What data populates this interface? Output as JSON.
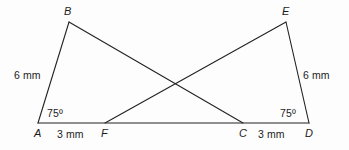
{
  "figure": {
    "background_color": "#fdfdfd",
    "stroke_color": "#222222",
    "text_color": "#1c1c1c",
    "stroke_width": 1.1,
    "vertices": {
      "A": {
        "label": "A",
        "x": 38,
        "y": 123
      },
      "B": {
        "label": "B",
        "x": 69,
        "y": 22
      },
      "C": {
        "label": "C",
        "x": 243,
        "y": 123
      },
      "D": {
        "label": "D",
        "x": 309,
        "y": 123
      },
      "E": {
        "label": "E",
        "x": 286,
        "y": 22
      },
      "F": {
        "label": "F",
        "x": 105,
        "y": 123
      }
    },
    "segments": [
      {
        "name": "segment-AB",
        "from": "A",
        "to": "B"
      },
      {
        "name": "segment-BC",
        "from": "B",
        "to": "C"
      },
      {
        "name": "segment-AD-baseline",
        "from": "A",
        "to": "D"
      },
      {
        "name": "segment-FE",
        "from": "F",
        "to": "E"
      },
      {
        "name": "segment-ED",
        "from": "E",
        "to": "D"
      }
    ],
    "intersection_point": {
      "x": 173,
      "y": 85
    },
    "labels": {
      "vertex_a": "A",
      "vertex_b": "B",
      "vertex_c": "C",
      "vertex_d": "D",
      "vertex_e": "E",
      "vertex_f": "F",
      "side_ab_length": "6 mm",
      "side_ed_length": "6 mm",
      "segment_af_length": "3 mm",
      "segment_cd_length": "3 mm",
      "angle_at_a": "75º",
      "angle_at_d": "75º"
    }
  }
}
